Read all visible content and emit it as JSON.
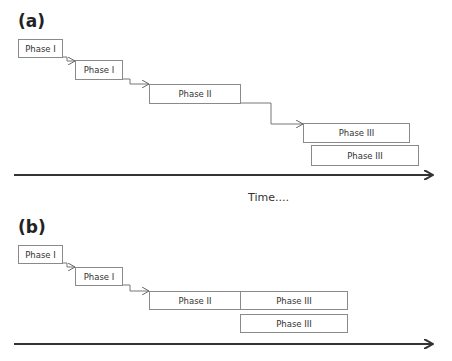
{
  "panels": {
    "a": {
      "label": "(a)",
      "boxes": [
        {
          "label": "Phase I"
        },
        {
          "label": "Phase I"
        },
        {
          "label": "Phase II"
        },
        {
          "label": "Phase III"
        },
        {
          "label": "Phase III"
        }
      ],
      "axis_label": "Time...."
    },
    "b": {
      "label": "(b)",
      "boxes": [
        {
          "label": "Phase I"
        },
        {
          "label": "Phase I"
        },
        {
          "label": "Phase II"
        },
        {
          "label": "Phase III"
        },
        {
          "label": "Phase III"
        }
      ]
    }
  },
  "colors": {
    "box_border": "#8a8a8a",
    "axis": "#333333",
    "connector": "#777777"
  }
}
